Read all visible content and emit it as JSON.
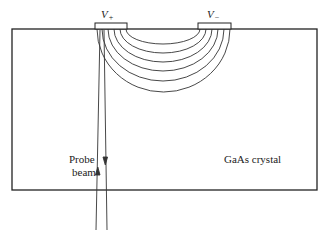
{
  "diagram": {
    "crystal": {
      "label": "GaAs crystal"
    },
    "electrodes": [
      {
        "id": "positive",
        "symbol": "V",
        "subscript": "+"
      },
      {
        "id": "negative",
        "symbol": "V",
        "subscript": "−"
      }
    ],
    "probe": {
      "label_line1": "Probe",
      "label_line2": "beam"
    },
    "field_lines": {
      "count": 6
    }
  }
}
